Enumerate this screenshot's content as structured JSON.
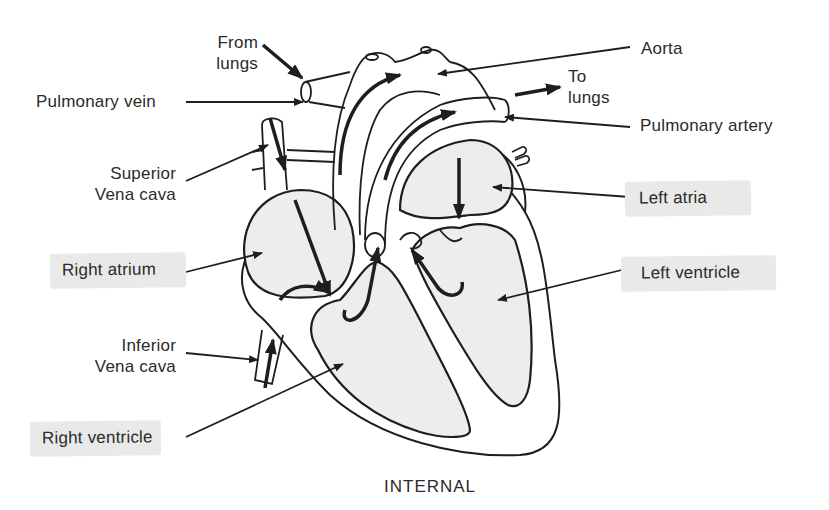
{
  "diagram": {
    "title": "INTERNAL",
    "colors": {
      "line": "#1e1e1e",
      "chamber_fill": "#ededed",
      "highlight": "#e9e9e9",
      "text": "#2b2b2b"
    },
    "labels": {
      "from_lungs_1": "From",
      "from_lungs_2": "lungs",
      "aorta": "Aorta",
      "to_lungs_1": "To",
      "to_lungs_2": "lungs",
      "pulmonary_vein": "Pulmonary vein",
      "pulmonary_artery": "Pulmonary artery",
      "superior_vena_cava_1": "Superior",
      "superior_vena_cava_2": "Vena cava",
      "left_atria": "Left atria",
      "right_atrium": "Right atrium",
      "left_ventricle": "Left ventricle",
      "inferior_vena_cava_1": "Inferior",
      "inferior_vena_cava_2": "Vena cava",
      "right_ventricle": "Right ventricle"
    },
    "highlighted_labels": [
      "Left atria",
      "Right atrium",
      "Left ventricle",
      "Right ventricle"
    ]
  }
}
